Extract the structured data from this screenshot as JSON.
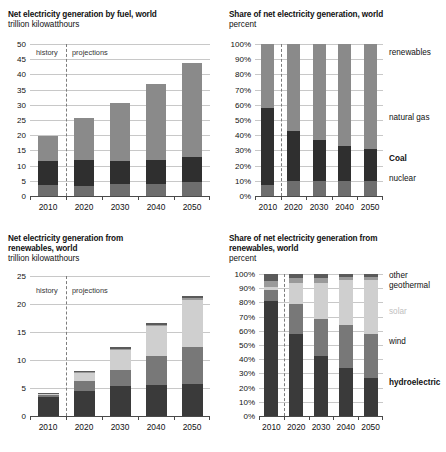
{
  "figure": {
    "units_note": "trillion kilowatthours",
    "percent_note": "percent",
    "era_history": "history",
    "era_projections": "projections"
  },
  "panels": {
    "top_left": {
      "title": "Net electricity generation by fuel, world",
      "subtitle": "trillion kilowatthours"
    },
    "top_right": {
      "title": "Share of net electricity generation, world",
      "subtitle": "percent"
    },
    "bottom_left": {
      "title": "Net electricity generation from\nrenewables, world",
      "subtitle": "trillion kilowatthours"
    },
    "bottom_right": {
      "title": "Share of net electricity generation from\nrenewables, world",
      "subtitle": "percent"
    }
  },
  "colors": {
    "nuclear": "#6e6e6e",
    "coal": "#2f2f2f",
    "natural_gas": "#8a8a8a",
    "renewables": "#8a8a8a",
    "hydroelectric": "#3a3a3a",
    "wind": "#787878",
    "solar": "#cfcfcf",
    "geothermal": "#9a9a9a",
    "other": "#5a5a5a",
    "gridline": "#c8c8c8",
    "axis": "#4a4a4a",
    "divider": "#7d7d7d"
  },
  "chart_data": [
    {
      "id": "net-generation-by-fuel",
      "type": "bar",
      "stacked": true,
      "title": "Net electricity generation by fuel, world",
      "subtitle": "trillion kilowatthours",
      "xlabel": "",
      "ylabel": "trillion kilowatthours",
      "ylim": [
        0,
        50
      ],
      "ytick_values": [
        0,
        5,
        10,
        15,
        20,
        25,
        30,
        35,
        40,
        45,
        50
      ],
      "ytick_labels": [
        "0",
        "5",
        "10",
        "15",
        "20",
        "25",
        "30",
        "35",
        "40",
        "45",
        "50"
      ],
      "grid": true,
      "legend_position": "right-inline",
      "categories": [
        "2010",
        "2020",
        "2030",
        "2040",
        "2050"
      ],
      "series": [
        {
          "name": "nuclear",
          "values": [
            3.7,
            3.3,
            3.8,
            4.1,
            4.5
          ]
        },
        {
          "name": "Coal",
          "values": [
            7.8,
            8.4,
            7.7,
            7.6,
            8.4
          ]
        },
        {
          "name": "natural gas + renewables",
          "values": [
            8.3,
            13.8,
            19.2,
            25.1,
            30.9
          ]
        }
      ],
      "totals": [
        19.8,
        25.5,
        30.7,
        36.8,
        43.8
      ],
      "annotations": [
        {
          "text": "history",
          "x": "left of 2015 divider"
        },
        {
          "text": "projections",
          "x": "right of 2015 divider"
        }
      ],
      "divider_at": "2015"
    },
    {
      "id": "share-of-net-generation",
      "type": "bar",
      "stacked": true,
      "normalized": true,
      "title": "Share of net electricity generation, world",
      "subtitle": "percent",
      "xlabel": "",
      "ylabel": "percent",
      "ylim": [
        0,
        100
      ],
      "ytick_values": [
        0,
        10,
        20,
        30,
        40,
        50,
        60,
        70,
        80,
        90,
        100
      ],
      "ytick_labels": [
        "0%",
        "10%",
        "20%",
        "30%",
        "40%",
        "50%",
        "60%",
        "70%",
        "80%",
        "90%",
        "100%"
      ],
      "grid": true,
      "legend_position": "right-inline",
      "categories": [
        "2010",
        "2020",
        "2030",
        "2040",
        "2050"
      ],
      "series": [
        {
          "name": "nuclear",
          "values": [
            7,
            10,
            10,
            10,
            10
          ]
        },
        {
          "name": "Coal",
          "values": [
            51,
            33,
            27,
            23,
            21
          ]
        },
        {
          "name": "natural gas",
          "values": [
            21,
            22,
            23,
            24,
            24
          ]
        },
        {
          "name": "renewables",
          "values": [
            21,
            35,
            40,
            43,
            45
          ]
        }
      ],
      "legend_labels": [
        {
          "text": "renewables",
          "bold": false,
          "at_percent": 95
        },
        {
          "text": "natural gas",
          "bold": false,
          "at_percent": 52
        },
        {
          "text": "Coal",
          "bold": true,
          "at_percent": 25
        },
        {
          "text": "nuclear",
          "bold": false,
          "at_percent": 12
        }
      ],
      "divider_at": "2015"
    },
    {
      "id": "net-generation-from-renewables",
      "type": "bar",
      "stacked": true,
      "title": "Net electricity generation from renewables, world",
      "subtitle": "trillion kilowatthours",
      "xlabel": "",
      "ylabel": "trillion kilowatthours",
      "ylim": [
        0,
        25
      ],
      "ytick_values": [
        0,
        5,
        10,
        15,
        20,
        25
      ],
      "ytick_labels": [
        "0",
        "5",
        "10",
        "15",
        "20",
        "25"
      ],
      "grid": true,
      "legend_position": "none",
      "categories": [
        "2010",
        "2020",
        "2030",
        "2040",
        "2050"
      ],
      "series": [
        {
          "name": "hydroelectric",
          "values": [
            3.4,
            4.5,
            5.3,
            5.6,
            5.7
          ]
        },
        {
          "name": "wind",
          "values": [
            0.4,
            1.7,
            3.0,
            5.1,
            6.7
          ]
        },
        {
          "name": "solar",
          "values": [
            0.05,
            1.4,
            3.5,
            5.3,
            8.3
          ]
        },
        {
          "name": "geothermal",
          "values": [
            0.15,
            0.2,
            0.2,
            0.3,
            0.3
          ]
        },
        {
          "name": "other",
          "values": [
            0.2,
            0.3,
            0.3,
            0.4,
            0.4
          ]
        }
      ],
      "totals": [
        4.2,
        8.1,
        12.3,
        16.7,
        21.4
      ],
      "annotations": [
        {
          "text": "history",
          "x": "left of 2015 divider"
        },
        {
          "text": "projections",
          "x": "right of 2015 divider"
        }
      ],
      "divider_at": "2015"
    },
    {
      "id": "share-of-renewables",
      "type": "bar",
      "stacked": true,
      "normalized": true,
      "title": "Share of net electricity generation from renewables, world",
      "subtitle": "percent",
      "xlabel": "",
      "ylabel": "percent",
      "ylim": [
        0,
        100
      ],
      "ytick_values": [
        0,
        10,
        20,
        30,
        40,
        50,
        60,
        70,
        80,
        90,
        100
      ],
      "ytick_labels": [
        "0%",
        "10%",
        "20%",
        "30%",
        "40%",
        "50%",
        "60%",
        "70%",
        "80%",
        "90%",
        "100%"
      ],
      "grid": true,
      "legend_position": "right-inline",
      "categories": [
        "2010",
        "2020",
        "2030",
        "2040",
        "2050"
      ],
      "series": [
        {
          "name": "hydroelectric",
          "values": [
            81,
            58,
            42,
            34,
            27
          ]
        },
        {
          "name": "wind",
          "values": [
            8,
            21,
            26,
            30,
            31
          ]
        },
        {
          "name": "solar",
          "values": [
            2,
            15,
            26,
            32,
            38
          ]
        },
        {
          "name": "geothermal",
          "values": [
            4,
            3,
            3,
            2,
            2
          ]
        },
        {
          "name": "other",
          "values": [
            5,
            3,
            3,
            2,
            2
          ]
        }
      ],
      "legend_labels": [
        {
          "text": "other",
          "bold": false,
          "at_percent": 99
        },
        {
          "text": "geothermal",
          "bold": false,
          "at_percent": 92
        },
        {
          "text": "solar",
          "bold": false,
          "at_percent": 74,
          "muted": true
        },
        {
          "text": "wind",
          "bold": false,
          "at_percent": 53
        },
        {
          "text": "hydroelectric",
          "bold": true,
          "at_percent": 24
        }
      ],
      "divider_at": "2015"
    }
  ]
}
